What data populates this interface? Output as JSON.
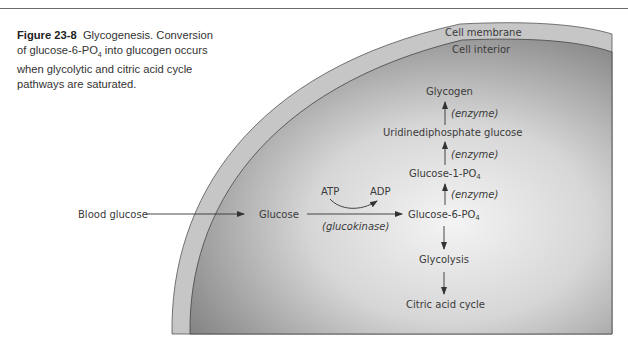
{
  "caption": {
    "figure_label": "Figure 23-8",
    "title": "Glycogenesis.",
    "text_part1": "Conversion of glucose-6-PO",
    "text_sub": "4",
    "text_part2": " into glucogen occurs when glycolytic and citric acid cycle pathways are saturated."
  },
  "regions": {
    "membrane": "Cell membrane",
    "interior": "Cell interior"
  },
  "nodes": {
    "blood_glucose": "Blood glucose",
    "glucose": "Glucose",
    "atp": "ATP",
    "adp": "ADP",
    "glucokinase": "(glucokinase)",
    "glucose6": "Glucose-6-PO",
    "glucose1": "Glucose-1-PO",
    "sub4": "4",
    "udp_glucose": "Uridinediphosphate glucose",
    "glycogen": "Glycogen",
    "enzyme": "(enzyme)",
    "glycolysis": "Glycolysis",
    "citric": "Citric acid cycle"
  },
  "colors": {
    "membrane": "#c9c9c9",
    "interior_dark": "#8f8f8f",
    "interior_light": "#eeeeee",
    "text": "#3a3a3a"
  }
}
